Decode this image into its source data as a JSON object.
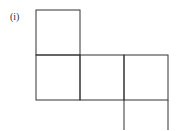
{
  "figure": {
    "label": "(i)",
    "stroke_color": "#333333"
  }
}
